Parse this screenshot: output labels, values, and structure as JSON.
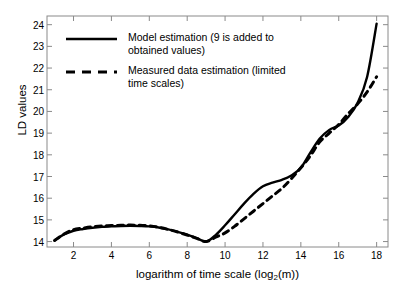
{
  "chart_data": {
    "type": "line",
    "title": "",
    "xlabel": "logarithm of time scale  (log2(m))",
    "xlabel_main": "logarithm of time scale  (log",
    "xlabel_sub": "2",
    "xlabel_tail": "(m))",
    "ylabel": "LD values",
    "xlim": [
      0.6,
      18.6
    ],
    "ylim": [
      13.75,
      24.4
    ],
    "grid": false,
    "legend_position": "top-left-inside",
    "xticks": [
      2,
      4,
      6,
      8,
      10,
      12,
      14,
      16,
      18
    ],
    "yticks": [
      14,
      15,
      16,
      17,
      18,
      19,
      20,
      21,
      22,
      23,
      24
    ],
    "series": [
      {
        "name": "Model estimation (9 is added to obtained values)",
        "style": "solid",
        "color": "#000000",
        "x": [
          1,
          1.5,
          2,
          2.5,
          3,
          3.5,
          4,
          4.5,
          5,
          5.5,
          6,
          6.5,
          7,
          7.5,
          8,
          8.5,
          9,
          9.5,
          10,
          10.5,
          11,
          11.5,
          12,
          12.5,
          13,
          13.5,
          14,
          14.5,
          15,
          15.5,
          16,
          16.5,
          17,
          17.5,
          18
        ],
        "y": [
          14.05,
          14.33,
          14.5,
          14.58,
          14.64,
          14.68,
          14.7,
          14.72,
          14.73,
          14.72,
          14.7,
          14.65,
          14.56,
          14.45,
          14.32,
          14.16,
          14.0,
          14.3,
          14.75,
          15.25,
          15.75,
          16.2,
          16.55,
          16.72,
          16.85,
          17.05,
          17.4,
          18.1,
          18.75,
          19.15,
          19.35,
          19.75,
          20.4,
          21.6,
          24.05
        ]
      },
      {
        "name": "Measured data estimation (limited time scales)",
        "style": "dashed",
        "color": "#000000",
        "x": [
          1,
          1.5,
          2,
          2.5,
          3,
          3.5,
          4,
          4.5,
          5,
          5.5,
          6,
          6.5,
          7,
          7.5,
          8,
          8.5,
          9,
          9.5,
          10,
          10.5,
          11,
          11.5,
          12,
          12.5,
          13,
          13.5,
          14,
          14.5,
          15,
          15.5,
          16,
          16.5,
          17,
          17.5,
          18
        ],
        "y": [
          14.05,
          14.35,
          14.55,
          14.62,
          14.68,
          14.72,
          14.74,
          14.75,
          14.76,
          14.75,
          14.72,
          14.66,
          14.56,
          14.44,
          14.3,
          14.15,
          14.0,
          14.2,
          14.4,
          14.7,
          15.05,
          15.4,
          15.75,
          16.1,
          16.45,
          16.9,
          17.4,
          17.95,
          18.6,
          19.0,
          19.4,
          19.9,
          20.35,
          20.9,
          21.6
        ]
      }
    ]
  },
  "legend": {
    "entries": [
      {
        "label": "Model estimation (9 is added to\nobtained values)",
        "style": "solid"
      },
      {
        "label": "Measured data estimation (limited\ntime scales)",
        "style": "dashed"
      }
    ]
  },
  "axis": {
    "x_ticklabels": [
      "2",
      "4",
      "6",
      "8",
      "10",
      "12",
      "14",
      "16",
      "18"
    ],
    "y_ticklabels": [
      "14",
      "15",
      "16",
      "17",
      "18",
      "19",
      "20",
      "21",
      "22",
      "23",
      "24"
    ]
  }
}
